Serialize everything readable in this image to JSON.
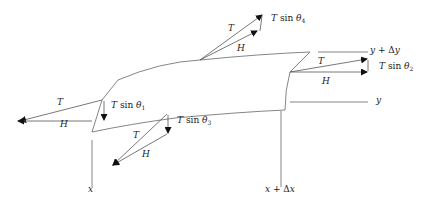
{
  "diagram": {
    "labels": {
      "T_top": "T",
      "H_top": "H",
      "Tsin4_T": "T",
      "Tsin4_fn": "sin",
      "Tsin4_theta": "θ",
      "Tsin4_sub": "4",
      "y_dy_label": "y + Δy",
      "T_right": "T",
      "H_right": "H",
      "Tsin2_T": "T",
      "Tsin2_fn": "sin",
      "Tsin2_theta": "θ",
      "Tsin2_sub": "2",
      "y_label": "y",
      "T_left": "T",
      "H_left": "H",
      "Tsin1_T": "T",
      "Tsin1_fn": "sin",
      "Tsin1_theta": "θ",
      "Tsin1_sub": "1",
      "T_bottom": "T",
      "H_bottom": "H",
      "Tsin3_T": "T",
      "Tsin3_fn": "sin",
      "Tsin3_theta": "θ",
      "Tsin3_sub": "3",
      "x_label": "x",
      "x_dx_label": "x + Δx"
    },
    "stroke_color": "#555555",
    "arrow_color": "#111111"
  }
}
